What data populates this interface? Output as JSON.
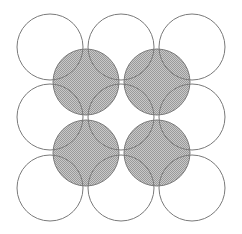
{
  "diagram": {
    "colors": {
      "background": "#ffffff",
      "stroke": "#7a7a7a",
      "shaded_fill": "#c8c8c8",
      "stipple": "#9a9a9a"
    },
    "radius": 33,
    "outline_circles": [
      {
        "cx": 50,
        "cy": 47
      },
      {
        "cx": 121,
        "cy": 47
      },
      {
        "cx": 192,
        "cy": 47
      },
      {
        "cx": 50,
        "cy": 117
      },
      {
        "cx": 121,
        "cy": 117
      },
      {
        "cx": 192,
        "cy": 117
      },
      {
        "cx": 50,
        "cy": 188
      },
      {
        "cx": 121,
        "cy": 188
      },
      {
        "cx": 192,
        "cy": 188
      }
    ],
    "shaded_circles": [
      {
        "cx": 86,
        "cy": 82
      },
      {
        "cx": 157,
        "cy": 82
      },
      {
        "cx": 86,
        "cy": 153
      },
      {
        "cx": 157,
        "cy": 153
      }
    ]
  }
}
